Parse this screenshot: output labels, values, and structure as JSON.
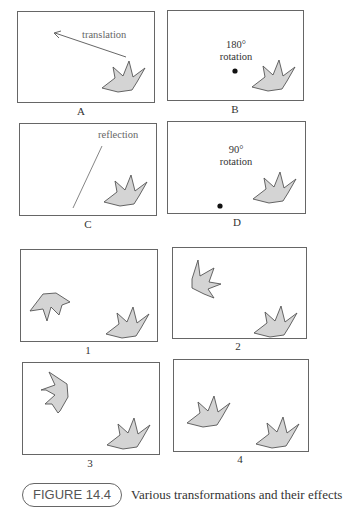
{
  "figure": {
    "panels": [
      {
        "id": "A",
        "label": "A",
        "annotation": "translation"
      },
      {
        "id": "B",
        "label": "B",
        "annotation_line1": "180°",
        "annotation_line2": "rotation"
      },
      {
        "id": "C",
        "label": "C",
        "annotation": "reflection"
      },
      {
        "id": "D",
        "label": "D",
        "annotation_line1": "90°",
        "annotation_line2": "rotation"
      },
      {
        "id": "1",
        "label": "1"
      },
      {
        "id": "2",
        "label": "2"
      },
      {
        "id": "3",
        "label": "3"
      },
      {
        "id": "4",
        "label": "4"
      }
    ],
    "caption": {
      "badge": "FIGURE 14.4",
      "text": "Various transformations and their effects"
    },
    "colors": {
      "shape_fill": "#d4d4d4",
      "shape_stroke": "#555555",
      "box_stroke": "#666666"
    }
  }
}
